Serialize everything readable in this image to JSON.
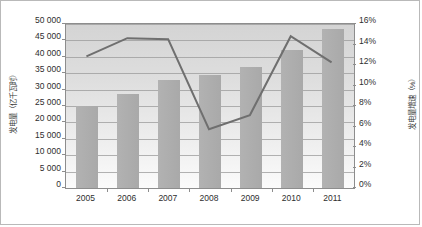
{
  "chart_data": {
    "type": "bar",
    "title": "",
    "xlabel": "",
    "categories": [
      "2005",
      "2006",
      "2007",
      "2008",
      "2009",
      "2010",
      "2011"
    ],
    "grid": true,
    "legend": "none",
    "series": [
      {
        "name": "发电量",
        "type": "bar",
        "axis": "left",
        "unit": "亿千瓦时",
        "values": [
          24900,
          28600,
          32800,
          34500,
          36800,
          42000,
          48500
        ]
      },
      {
        "name": "发电量增速",
        "type": "line",
        "axis": "right",
        "unit": "%",
        "values": [
          12.8,
          14.6,
          14.5,
          5.6,
          7.0,
          14.8,
          12.2
        ]
      }
    ],
    "y_left": {
      "label": "发电量（亿千瓦时）",
      "min": 0,
      "max": 50000,
      "step": 5000,
      "ticks": [
        "50 000",
        "45 000",
        "40 000",
        "35 000",
        "30 000",
        "25 000",
        "20 000",
        "15 000",
        "10 000",
        "5 000",
        "0"
      ],
      "tick_values": [
        50000,
        45000,
        40000,
        35000,
        30000,
        25000,
        20000,
        15000,
        10000,
        5000,
        0
      ]
    },
    "y_right": {
      "label": "发电量增速（%）",
      "min": 0,
      "max": 16,
      "step": 2,
      "ticks": [
        "16%",
        "14%",
        "12%",
        "10%",
        "8%",
        "6%",
        "4%",
        "2%",
        "0%"
      ],
      "tick_values": [
        16,
        14,
        12,
        10,
        8,
        6,
        4,
        2,
        0
      ]
    },
    "colors": {
      "bar": "#ababab",
      "line": "#6f6f6f",
      "plot_background": "#dedede",
      "gridline": "#9a9a9a",
      "axis": "#8d8d8d",
      "text": "#2e2e2e"
    }
  }
}
